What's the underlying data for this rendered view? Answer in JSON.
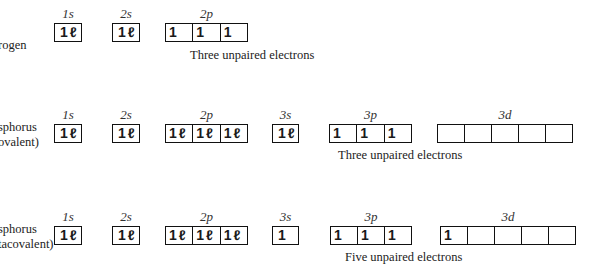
{
  "rows": [
    {
      "element_label": [
        "rogen"
      ],
      "note": "Three unpaired electrons",
      "orbitals": [
        {
          "name": "1s",
          "cells": [
            "1↿⇂"
          ]
        },
        {
          "name": "2s",
          "cells": [
            "1↿⇂"
          ]
        },
        {
          "name": "2p",
          "cells": [
            "1",
            "1",
            "1"
          ]
        }
      ]
    },
    {
      "element_label": [
        "sphorus",
        "ovalent)"
      ],
      "note": "Three unpaired electrons",
      "orbitals": [
        {
          "name": "1s",
          "cells": [
            "1↿⇂"
          ]
        },
        {
          "name": "2s",
          "cells": [
            "1↿⇂"
          ]
        },
        {
          "name": "2p",
          "cells": [
            "1↿⇂",
            "1↿⇂",
            "1↿⇂"
          ]
        },
        {
          "name": "3s",
          "cells": [
            "1↿⇂"
          ]
        },
        {
          "name": "3p",
          "cells": [
            "1",
            "1",
            "1"
          ]
        },
        {
          "name": "3d",
          "cells": [
            "",
            "",
            "",
            "",
            ""
          ]
        }
      ]
    },
    {
      "element_label": [
        "sphorus",
        "tacovalent)"
      ],
      "note": "Five unpaired electrons",
      "orbitals": [
        {
          "name": "1s",
          "cells": [
            "1↿⇂"
          ]
        },
        {
          "name": "2s",
          "cells": [
            "1↿⇂"
          ]
        },
        {
          "name": "2p",
          "cells": [
            "1↿⇂",
            "1↿⇂",
            "1↿⇂"
          ]
        },
        {
          "name": "3s",
          "cells": [
            "1"
          ]
        },
        {
          "name": "3p",
          "cells": [
            "1",
            "1",
            "1"
          ]
        },
        {
          "name": "3d",
          "cells": [
            "1",
            "",
            "",
            "",
            ""
          ]
        }
      ]
    }
  ],
  "symbols": {
    "up": "1",
    "down": "ℓ"
  }
}
